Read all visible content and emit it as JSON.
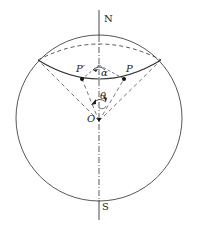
{
  "diagram": {
    "labels": {
      "north": "N",
      "south": "S",
      "center": "O",
      "point_p": "P",
      "point_p_prime": "P′",
      "angle_alpha": "α",
      "angle_theta": "θ"
    },
    "colors": {
      "stroke": "#333333",
      "background": "#ffffff"
    }
  }
}
